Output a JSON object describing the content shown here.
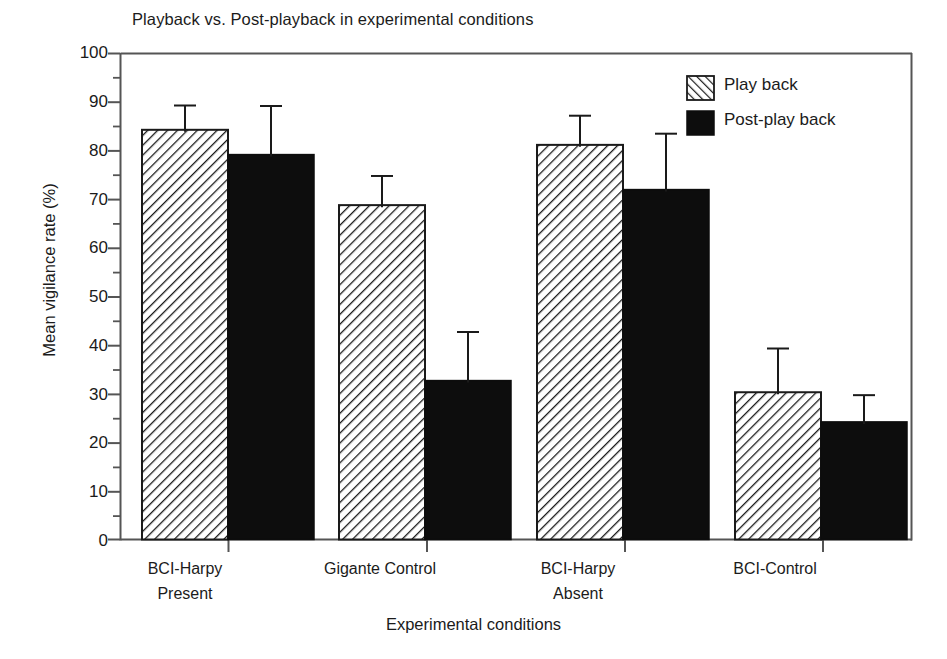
{
  "chart_data": {
    "type": "bar",
    "title": "Playback vs. Post-playback in experimental conditions",
    "xlabel": "Experimental conditions",
    "ylabel": "Mean vigilance rate (%)",
    "ylim": [
      0,
      100
    ],
    "yticks": [
      0,
      10,
      20,
      30,
      40,
      50,
      60,
      70,
      80,
      90,
      100
    ],
    "minor_tick_step": 5,
    "grid": false,
    "legend_position": "top-right",
    "categories": [
      "BCI-Harpy\nPresent",
      "Gigante Control",
      "BCI-Harpy\nAbsent",
      "BCI-Control"
    ],
    "category_lines": [
      [
        "BCI-Harpy",
        "Present"
      ],
      [
        "Gigante Control",
        ""
      ],
      [
        "BCI-Harpy",
        "Absent"
      ],
      [
        "BCI-Control",
        ""
      ]
    ],
    "series": [
      {
        "name": "Play back",
        "fill": "hatched",
        "color": "#ffffff",
        "hatch_color": "#1a1a1a",
        "values": [
          84.3,
          68.8,
          81.2,
          30.3
        ],
        "errors": [
          5.0,
          6.0,
          6.0,
          9.0
        ]
      },
      {
        "name": "Post-play back",
        "fill": "solid",
        "color": "#0d0d0d",
        "hatch_color": "#0d0d0d",
        "values": [
          79.2,
          32.7,
          72.0,
          24.2
        ],
        "errors": [
          10.0,
          10.0,
          11.5,
          5.5
        ]
      }
    ]
  },
  "legend": {
    "items": [
      {
        "label": "Play back",
        "swatch": "hatched"
      },
      {
        "label": "Post-play back",
        "swatch": "solid"
      }
    ]
  },
  "axis": {
    "y_tick_labels": [
      "100",
      "90",
      "80",
      "70",
      "60",
      "50",
      "40",
      "30",
      "20",
      "10",
      "0"
    ]
  },
  "colors": {
    "axis": "#555555",
    "bar_outline": "#1a1a1a",
    "bar_solid": "#0d0d0d",
    "text": "#1b1b1b",
    "background": "#ffffff"
  }
}
